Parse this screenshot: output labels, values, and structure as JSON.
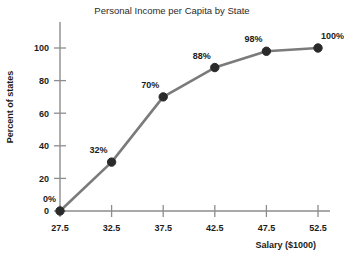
{
  "chart_data": {
    "type": "line",
    "title": "Personal Income per Capita by State",
    "xlabel": "Salary ($1000)",
    "ylabel": "Percent of states",
    "x": [
      27.5,
      32.5,
      37.5,
      42.5,
      47.5,
      52.5
    ],
    "values": [
      0,
      30,
      70,
      88,
      98,
      100
    ],
    "point_labels": [
      "0%",
      "32%",
      "70%",
      "88%",
      "98%",
      "100%"
    ],
    "xticks": [
      27.5,
      32.5,
      37.5,
      42.5,
      47.5,
      52.5
    ],
    "xtick_labels": [
      "27.5",
      "32.5",
      "37.5",
      "42.5",
      "47.5",
      "52.5"
    ],
    "yticks": [
      0,
      20,
      40,
      60,
      80,
      100
    ],
    "ytick_labels": [
      "0",
      "20",
      "40",
      "60",
      "80",
      "100"
    ],
    "xlim": [
      27.5,
      52.5
    ],
    "ylim": [
      0,
      100
    ],
    "grid": false,
    "legend": "none",
    "line_color": "#7b7b7b",
    "marker_color": "#2a2a2a",
    "axis_color": "#8d8d8d",
    "text_color": "#1c1c1c",
    "background_color": "#ffffff"
  }
}
